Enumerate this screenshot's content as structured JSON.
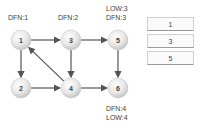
{
  "nodes": [
    {
      "id": "1",
      "x": 21,
      "y": 40
    },
    {
      "id": "3",
      "x": 71,
      "y": 40
    },
    {
      "id": "5",
      "x": 118,
      "y": 40
    },
    {
      "id": "2",
      "x": 21,
      "y": 88
    },
    {
      "id": "4",
      "x": 71,
      "y": 88
    },
    {
      "id": "6",
      "x": 118,
      "y": 88
    }
  ],
  "edges": [
    {
      "from": "1",
      "to": "3"
    },
    {
      "from": "3",
      "to": "5"
    },
    {
      "from": "1",
      "to": "2"
    },
    {
      "from": "3",
      "to": "4"
    },
    {
      "from": "5",
      "to": "6"
    },
    {
      "from": "2",
      "to": "4"
    },
    {
      "from": "4",
      "to": "6"
    },
    {
      "from": "4",
      "to": "1"
    }
  ],
  "labels": {
    "node1_dfn": "DFN:1",
    "node3_dfn": "DFN:2",
    "node5_low": "LOW:3",
    "node5_dfn": "DFN:3",
    "node6_dfn": "DFN:4",
    "node6_low": "LOW:4"
  },
  "stack": {
    "items": [
      "1",
      "3",
      "5"
    ]
  }
}
